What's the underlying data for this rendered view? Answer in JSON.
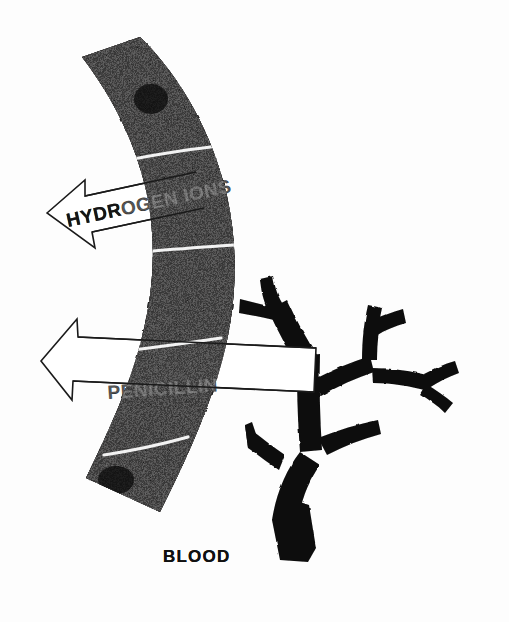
{
  "figure": {
    "title_visible": false,
    "background_color": "#fdfdfd",
    "ink_color": "#1a1a1a",
    "membrane_color": "#1d1c1c",
    "vessel_color": "#0b0b0b",
    "arrow_fill_color": "#ffffff"
  },
  "labels": {
    "hydrogen_ions": "HYDROGEN IONS",
    "penicillin": "PENICILLIN",
    "blood": "BLOOD"
  },
  "arrows": [
    {
      "name": "hydrogen-ions-arrow",
      "label": "HYDROGEN IONS",
      "direction": "left",
      "style": "outlined-block-arrow"
    },
    {
      "name": "penicillin-arrow",
      "label": "PENICILLIN",
      "direction": "left",
      "style": "outlined-block-arrow"
    }
  ],
  "structures": {
    "membrane": {
      "name": "gastric-mucosa-band",
      "segment_count": 5,
      "nucleus_count": 2
    },
    "vessel": {
      "name": "blood-vessel-tree",
      "branch_count": 9
    }
  },
  "caption": {
    "blood_label": "BLOOD"
  }
}
